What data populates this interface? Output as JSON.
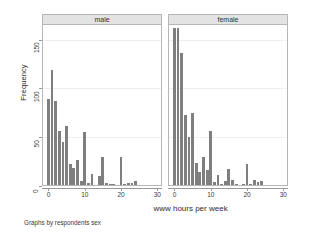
{
  "chart_data": {
    "type": "bar",
    "title": "",
    "subtitle": "",
    "xlabel": "www hours per week",
    "ylabel": "Frequency",
    "footnote": "Graphs by respondents sex",
    "xlim": [
      -1.5,
      31
    ],
    "ylim": [
      0,
      165
    ],
    "xticks": [
      0,
      10,
      20,
      30
    ],
    "yticks": [
      0,
      50,
      100,
      150
    ],
    "grid": true,
    "legend": "none",
    "legend_position": "none",
    "bar_color": "#7f7f7f",
    "panel_header_color": "#e3e3e3",
    "panels": [
      {
        "label": "male",
        "x": [
          0,
          1,
          2,
          3,
          4,
          5,
          6,
          7,
          8,
          9,
          10,
          11,
          12,
          13,
          14,
          15,
          16,
          17,
          18,
          19,
          20,
          21,
          22,
          23,
          24
        ],
        "values": [
          88,
          118,
          86,
          55,
          44,
          60,
          22,
          17,
          26,
          4,
          54,
          2,
          11,
          0,
          9,
          29,
          2,
          1,
          1,
          0,
          29,
          1,
          2,
          2,
          4
        ]
      },
      {
        "label": "female",
        "x": [
          0,
          1,
          2,
          3,
          4,
          5,
          6,
          7,
          8,
          9,
          10,
          11,
          12,
          13,
          14,
          15,
          16,
          17,
          18,
          19,
          20,
          21,
          22,
          23,
          24
        ],
        "values": [
          161,
          161,
          135,
          72,
          49,
          74,
          23,
          13,
          29,
          15,
          55,
          3,
          10,
          1,
          4,
          16,
          5,
          1,
          0,
          1,
          22,
          1,
          5,
          3,
          4
        ]
      }
    ]
  },
  "axes": {
    "ytick_labels": [
      "0",
      "50",
      "100",
      "150"
    ],
    "xtick_labels": [
      "0",
      "10",
      "20",
      "30"
    ]
  }
}
